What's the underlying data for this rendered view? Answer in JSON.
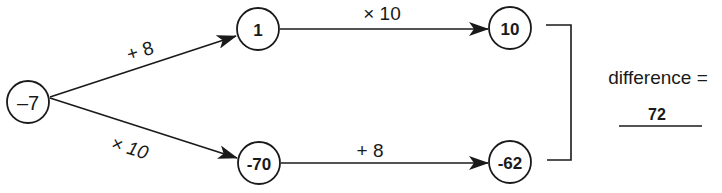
{
  "diagram": {
    "colors": {
      "ink": "#1a1a1a",
      "background": "#ffffff"
    },
    "nodes": {
      "start": {
        "label": "–7"
      },
      "top_mid": {
        "label": "1"
      },
      "top_end": {
        "label": "10"
      },
      "bottom_mid": {
        "label": "-70"
      },
      "bottom_end": {
        "label": "-62"
      }
    },
    "edges": {
      "start_to_top_mid": {
        "label": "+ 8"
      },
      "start_to_bottom_mid": {
        "label": "× 10"
      },
      "top_mid_to_top_end": {
        "label": "× 10"
      },
      "bottom_mid_to_bottom_end": {
        "label": "+ 8"
      }
    },
    "result": {
      "label": "difference =",
      "value": "72"
    }
  }
}
